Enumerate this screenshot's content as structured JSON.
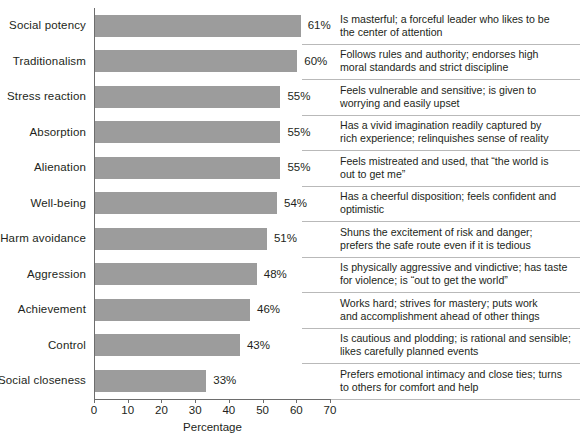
{
  "chart_data": {
    "type": "bar",
    "orientation": "horizontal",
    "title": "",
    "xlabel": "Percentage",
    "ylabel": "",
    "xlim": [
      0,
      70
    ],
    "xticks": [
      0,
      10,
      20,
      30,
      40,
      50,
      60,
      70
    ],
    "grid": false,
    "legend": null,
    "bar_color": "#9c9c9c",
    "axis_color": "#6d6d6d",
    "divider_color": "#b9b9b9",
    "categories": [
      "Social potency",
      "Traditionalism",
      "Stress reaction",
      "Absorption",
      "Alienation",
      "Well-being",
      "Harm avoidance",
      "Aggression",
      "Achievement",
      "Control",
      "Social closeness"
    ],
    "values": [
      61,
      60,
      55,
      55,
      55,
      54,
      51,
      48,
      46,
      43,
      33
    ],
    "value_labels": [
      "61%",
      "60%",
      "55%",
      "55%",
      "55%",
      "54%",
      "51%",
      "48%",
      "46%",
      "43%",
      "33%"
    ],
    "annotations": [
      "Is masterful; a forceful leader who likes to be the center of attention",
      "Follows rules and authority; endorses high moral standards and strict discipline",
      "Feels vulnerable and sensitive; is given to worrying and easily upset",
      "Has a vivid imagination readily captured by rich experience; relinquishes sense of reality",
      "Feels mistreated and used, that “the world is out to get me”",
      "Has a cheerful disposition; feels confident and optimistic",
      "Shuns the excitement of risk and danger; prefers the safe route even if it is tedious",
      "Is physically aggressive and vindictive; has taste for violence; is “out to get the world”",
      "Works hard; strives for mastery; puts work and accomplishment ahead of other things",
      "Is cautious and plodding; is rational and sensible; likes carefully planned events",
      "Prefers emotional intimacy and close ties; turns to others for comfort and help"
    ],
    "annotation_lines": [
      [
        "Is masterful; a forceful leader who likes to be",
        "the center of attention"
      ],
      [
        "Follows rules and authority; endorses high",
        "moral standards and strict discipline"
      ],
      [
        "Feels vulnerable and sensitive; is given to",
        "worrying and easily upset"
      ],
      [
        "Has a vivid imagination readily captured by",
        "rich experience; relinquishes sense of reality"
      ],
      [
        "Feels mistreated and used, that “the world is",
        "out to get me”"
      ],
      [
        "Has a cheerful disposition; feels confident and",
        "optimistic"
      ],
      [
        "Shuns the excitement of risk and danger;",
        "prefers the safe route even if it is tedious"
      ],
      [
        "Is physically aggressive and vindictive; has taste",
        "for violence; is “out to get the world”"
      ],
      [
        "Works hard; strives for mastery; puts work",
        "and accomplishment ahead of other things"
      ],
      [
        "Is cautious and plodding; is rational and sensible;",
        "likes carefully planned events"
      ],
      [
        "Prefers emotional intimacy and close ties; turns",
        "to others for comfort and help"
      ]
    ]
  }
}
